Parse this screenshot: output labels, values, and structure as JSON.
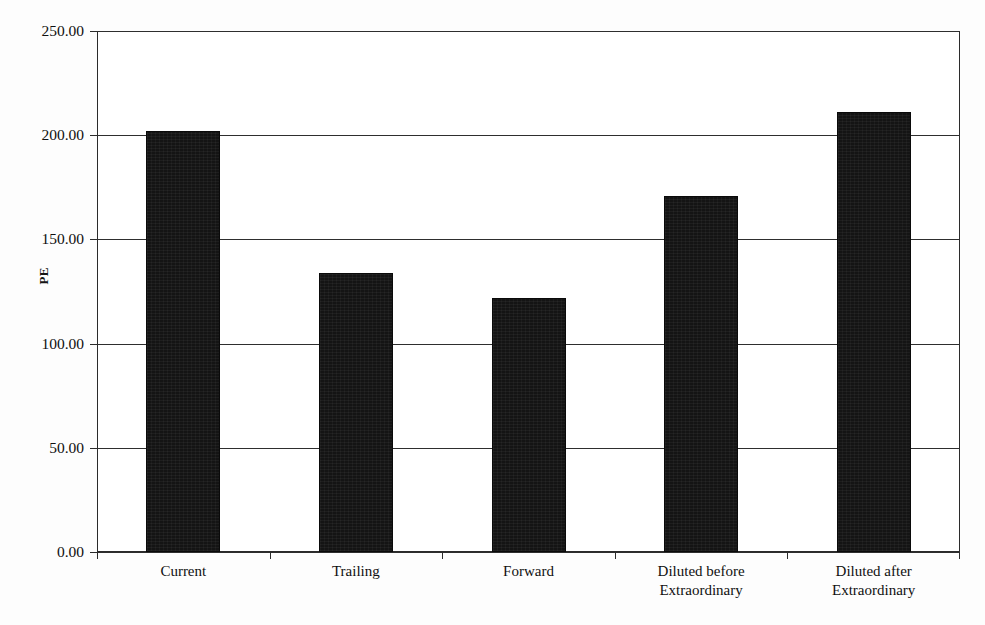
{
  "chart_data": {
    "type": "bar",
    "title": "",
    "subtitle": "",
    "xlabel": "",
    "ylabel": "PE",
    "categories": [
      "Current",
      "Trailing",
      "Forward",
      "Diluted before\nExtraordinary",
      "Diluted after\nExtraordinary"
    ],
    "values": [
      202.0,
      134.0,
      122.0,
      171.0,
      211.0
    ],
    "ylim": [
      0.0,
      250.0
    ],
    "ytick_values": [
      0.0,
      50.0,
      100.0,
      150.0,
      200.0,
      250.0
    ],
    "ytick_labels": [
      "0.00",
      "50.00",
      "100.00",
      "150.00",
      "200.00",
      "250.00"
    ],
    "grid": true,
    "grid_axis": "y",
    "legend": false,
    "legend_position": "none",
    "bar_color": "#141414",
    "axis_color": "#2b2b2b",
    "plot_background": "#ffffff",
    "series": [
      {
        "name": "PE",
        "values": [
          202.0,
          134.0,
          122.0,
          171.0,
          211.0
        ]
      }
    ]
  },
  "axis": {
    "y_title": "PE"
  }
}
